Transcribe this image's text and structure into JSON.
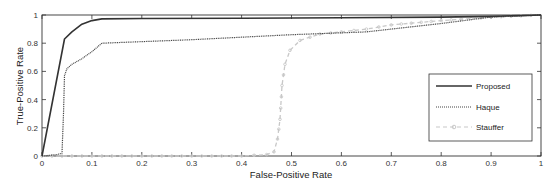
{
  "chart_data": {
    "type": "line",
    "title": "",
    "xlabel": "False-Positive Rate",
    "ylabel": "True-Positive Rate",
    "xlim": [
      0,
      1
    ],
    "ylim": [
      0,
      1
    ],
    "grid": false,
    "legend_position": "lower right",
    "xticks": [
      "0",
      "0.1",
      "0.2",
      "0.3",
      "0.4",
      "0.5",
      "0.6",
      "0.7",
      "0.8",
      "0.9",
      "1"
    ],
    "yticks": [
      "0",
      "0.2",
      "0.4",
      "0.6",
      "0.8",
      "1"
    ],
    "series": [
      {
        "name": "Proposed",
        "style": "solid",
        "color": "#333333",
        "x": [
          0,
          0.045,
          0.06,
          0.08,
          0.1,
          0.12,
          0.2,
          0.4,
          0.6,
          0.8,
          0.9,
          1.0
        ],
        "y": [
          0,
          0.83,
          0.88,
          0.935,
          0.96,
          0.972,
          0.975,
          0.977,
          0.98,
          0.985,
          0.99,
          1.0
        ]
      },
      {
        "name": "Haque",
        "style": "dotted",
        "color": "#444444",
        "x": [
          0,
          0.03,
          0.04,
          0.043,
          0.045,
          0.05,
          0.06,
          0.08,
          0.1,
          0.12,
          0.3,
          0.5,
          0.65,
          0.8,
          0.9,
          1.0
        ],
        "y": [
          0,
          0.01,
          0.02,
          0.3,
          0.57,
          0.62,
          0.65,
          0.69,
          0.74,
          0.8,
          0.825,
          0.86,
          0.88,
          0.94,
          0.985,
          1.0
        ]
      },
      {
        "name": "Stauffer",
        "style": "dashed-circle-markers",
        "color": "#c8c8c8",
        "x": [
          0,
          0.1,
          0.2,
          0.3,
          0.4,
          0.45,
          0.465,
          0.472,
          0.477,
          0.481,
          0.487,
          0.497,
          0.517,
          0.557,
          0.6,
          0.65,
          0.7,
          0.8,
          0.9,
          1.0
        ],
        "y": [
          0,
          0.0,
          0.0,
          0.0,
          0.0,
          0.01,
          0.03,
          0.12,
          0.26,
          0.5,
          0.65,
          0.75,
          0.82,
          0.865,
          0.88,
          0.9,
          0.93,
          0.96,
          0.985,
          1.0
        ]
      }
    ]
  },
  "legend": {
    "items": [
      "Proposed",
      "Haque",
      "Stauffer"
    ]
  }
}
